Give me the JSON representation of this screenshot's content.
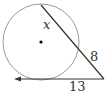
{
  "diagram": {
    "type": "circle-secant-tangent",
    "labels": {
      "secant_inner": "x",
      "secant_outer": "8",
      "tangent": "13"
    },
    "colors": {
      "circle": "#9a9a9a",
      "lines": "#333333",
      "center_dot": "#000000"
    }
  }
}
